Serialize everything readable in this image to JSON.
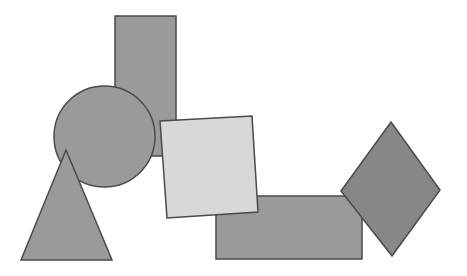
{
  "canvas": {
    "name": "geometric-shapes-scene",
    "width": 467,
    "height": 276,
    "background_color": "#ffffff"
  },
  "palette": {
    "shape_gray": "#9a9a9a",
    "shape_gray_dark": "#878787",
    "shape_light": "#d8d8d8",
    "stroke": "#4a4a4a",
    "background": "#ffffff"
  },
  "shapes": [
    {
      "id": "tall-rectangle",
      "label": "Tall vertical rectangle",
      "kind": "rectangle",
      "fill": "#9a9a9a",
      "stroke": "#4a4a4a",
      "stroke_width": 1.5,
      "x": 115,
      "y": 16,
      "width": 61,
      "height": 140,
      "z": 1
    },
    {
      "id": "circle",
      "label": "Circle",
      "kind": "circle",
      "fill": "#9a9a9a",
      "stroke": "#4a4a4a",
      "stroke_width": 1.5,
      "cx": 104.5,
      "cy": 136.5,
      "r": 50.5,
      "z": 2
    },
    {
      "id": "triangle",
      "label": "Triangle",
      "kind": "polygon",
      "fill": "#9a9a9a",
      "stroke": "#4a4a4a",
      "stroke_width": 1.5,
      "points": "66,150 112,260 21,260",
      "z": 3
    },
    {
      "id": "horizontal-rectangle",
      "label": "Wide horizontal rectangle",
      "kind": "rectangle",
      "fill": "#9a9a9a",
      "stroke": "#4a4a4a",
      "stroke_width": 1.5,
      "x": 216,
      "y": 196,
      "width": 146,
      "height": 63,
      "z": 4
    },
    {
      "id": "diamond",
      "label": "Diamond (rotated square)",
      "kind": "polygon",
      "fill": "#878787",
      "stroke": "#4a4a4a",
      "stroke_width": 1.5,
      "points": "391,122 440,190 392,256 341,191",
      "z": 5
    },
    {
      "id": "light-square",
      "label": "Light rotated square",
      "kind": "polygon",
      "fill": "#d8d8d8",
      "stroke": "#4a4a4a",
      "stroke_width": 1.5,
      "points": "160,121 252,116 258,212 167,218",
      "z": 6
    }
  ]
}
